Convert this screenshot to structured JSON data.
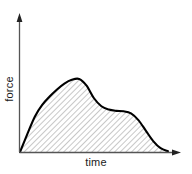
{
  "figure": {
    "name": "force-vs-time-curve",
    "background_color": "#ffffff",
    "line_color": "#000000",
    "hatch_color": "#9a9a9a",
    "axis_color": "#4a4a4a",
    "text_color": "#1a1a1a"
  },
  "labels": {
    "x_axis": "time",
    "y_axis": "force"
  },
  "chart_data": {
    "type": "area",
    "title": "",
    "xlabel": "time",
    "ylabel": "force",
    "grid": false,
    "legend": null,
    "fill": "hatched",
    "hatch_pattern": "diagonal-45",
    "axis_arrows": true,
    "tick_labels_x": [],
    "tick_labels_y": [],
    "xlim": [
      0,
      1
    ],
    "ylim": [
      0,
      1
    ],
    "x": [
      0.0,
      0.05,
      0.1,
      0.15,
      0.2,
      0.25,
      0.3,
      0.35,
      0.4,
      0.45,
      0.5,
      0.55,
      0.6,
      0.65,
      0.7,
      0.75,
      0.8,
      0.85,
      0.9,
      0.95,
      1.0
    ],
    "series": [
      {
        "name": "force",
        "values": [
          0.0,
          0.215,
          0.42,
          0.56,
          0.66,
          0.745,
          0.815,
          0.86,
          0.87,
          0.79,
          0.64,
          0.545,
          0.505,
          0.49,
          0.485,
          0.46,
          0.38,
          0.255,
          0.13,
          0.045,
          0.01
        ]
      }
    ],
    "features": {
      "primary_peak": {
        "x": 0.4,
        "y": 0.87
      },
      "secondary_shoulder": {
        "x": 0.69,
        "y": 0.487
      },
      "start": {
        "x": 0.0,
        "y": 0.0
      },
      "end": {
        "x": 1.0,
        "y": 0.01
      }
    }
  }
}
